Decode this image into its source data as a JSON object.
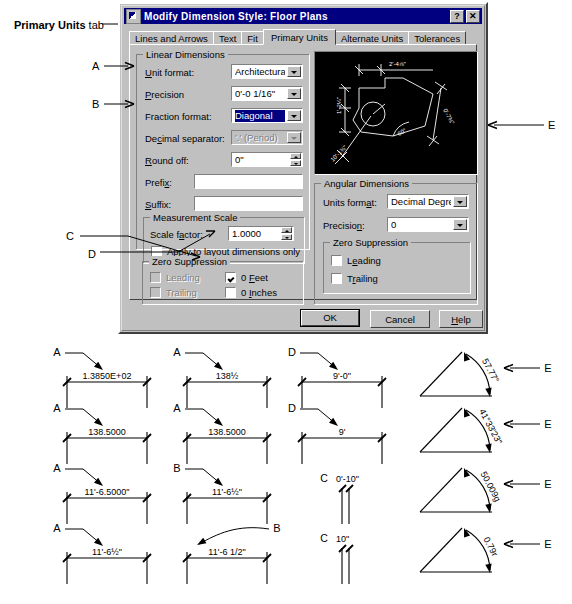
{
  "callout": {
    "primary_units_tab_bold": "Primary Units",
    "primary_units_tab_rest": " tab"
  },
  "dialog": {
    "title": "Modify Dimension Style: Floor Plans",
    "titlebar_icon": "dimension-style-icon",
    "help_button": "?",
    "close_button": "✕",
    "tabs": [
      {
        "label": "Lines and Arrows",
        "active": false
      },
      {
        "label": "Text",
        "active": false
      },
      {
        "label": "Fit",
        "active": false
      },
      {
        "label": "Primary Units",
        "active": true
      },
      {
        "label": "Alternate Units",
        "active": false
      },
      {
        "label": "Tolerances",
        "active": false
      }
    ],
    "linear": {
      "group_title": "Linear Dimensions",
      "unit_format_label": "Unit format:",
      "unit_format_value": "Architectural",
      "precision_label": "Precision",
      "precision_value": "0'-0 1/16\"",
      "fraction_format_label": "Fraction format:",
      "fraction_format_value": "Diagonal",
      "decimal_separator_label": "Decimal separator:",
      "decimal_separator_value": "'.' (Period)",
      "round_off_label": "Round off:",
      "round_off_value": "0\"",
      "prefix_label": "Prefix:",
      "prefix_value": "",
      "suffix_label": "Suffix:",
      "suffix_value": "",
      "measurement_scale_title": "Measurement Scale",
      "scale_factor_label": "Scale factor:",
      "scale_factor_value": "1.0000",
      "apply_layout_label": "Apply to layout dimensions only",
      "zero_suppression_title": "Zero Suppression",
      "leading_label": "Leading",
      "trailing_label": "Trailing",
      "zero_feet_label": "0 Feet",
      "zero_inches_label": "0 Inches"
    },
    "angular": {
      "group_title": "Angular Dimensions",
      "units_format_label": "Units format:",
      "units_format_value": "Decimal Degrees",
      "precision_label": "Precision:",
      "precision_value": "0",
      "zero_suppression_title": "Zero Suppression",
      "leading_label": "Leading",
      "trailing_label": "Trailing"
    },
    "preview": {
      "name": "dimension-style-preview",
      "dims": [
        "2'-4⅞\"",
        "1'-2¼\"",
        "0'-7¾\"",
        "60°",
        "10'-1⅜\""
      ]
    },
    "buttons": {
      "ok": "OK",
      "cancel": "Cancel",
      "help": "Help"
    }
  },
  "annotations": {
    "dialog_letters": [
      "A",
      "B",
      "C",
      "D",
      "E"
    ]
  },
  "examples": [
    {
      "letter": "A",
      "text": "1.3850E+02",
      "type": "linear",
      "col": 0,
      "row": 0
    },
    {
      "letter": "A",
      "text": "138½",
      "type": "linear",
      "col": 1,
      "row": 0
    },
    {
      "letter": "D",
      "text": "9'-0\"",
      "type": "linear",
      "col": 2,
      "row": 0
    },
    {
      "letter": "E",
      "text": "57.77°",
      "type": "angular",
      "col": 3,
      "row": 0
    },
    {
      "letter": "A",
      "text": "138.5000",
      "type": "linear",
      "col": 0,
      "row": 1
    },
    {
      "letter": "A",
      "text": "138.5000",
      "type": "linear",
      "col": 1,
      "row": 1
    },
    {
      "letter": "D",
      "text": "9'",
      "type": "linear",
      "col": 2,
      "row": 1
    },
    {
      "letter": "E",
      "text": "41°33'23\"",
      "type": "angular",
      "col": 3,
      "row": 1
    },
    {
      "letter": "A",
      "text": "11'-6.5000\"",
      "type": "linear",
      "col": 0,
      "row": 2
    },
    {
      "letter": "B",
      "text": "11'-6½\"",
      "type": "linear",
      "col": 1,
      "row": 2
    },
    {
      "letter": "C",
      "text": "0'-10\"",
      "type": "extline",
      "col": 2,
      "row": 2
    },
    {
      "letter": "E",
      "text": "50.009g",
      "type": "angular",
      "col": 3,
      "row": 2
    },
    {
      "letter": "A",
      "text": "11'-6½\"",
      "type": "linear",
      "col": 0,
      "row": 3
    },
    {
      "letter": "B",
      "text": "11'-6  1/2\"",
      "type": "linear",
      "col": 1,
      "row": 3
    },
    {
      "letter": "C",
      "text": "10\"",
      "type": "extline",
      "col": 2,
      "row": 3
    },
    {
      "letter": "E",
      "text": "0.79r",
      "type": "angular",
      "col": 3,
      "row": 3
    }
  ]
}
